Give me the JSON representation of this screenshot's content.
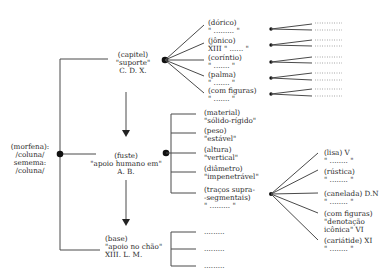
{
  "root": {
    "lines": [
      "(morfena):",
      "/coluna/",
      "semema:",
      "/coluna/"
    ]
  },
  "capitel": {
    "lines": [
      "(capitel)",
      "\"suporte\"",
      "C. D. X."
    ],
    "children": [
      {
        "lines": [
          "(dórico)",
          "\" ......... \""
        ]
      },
      {
        "lines": [
          "(jônico)",
          "XIII \" ...... \""
        ]
      },
      {
        "lines": [
          "(coríntio)",
          "\" ....... \""
        ]
      },
      {
        "lines": [
          "(palma)",
          "\" ....... \""
        ]
      },
      {
        "lines": [
          "(com figuras)",
          "\" ....... \""
        ]
      }
    ],
    "leaf_placeholder": "........."
  },
  "fuste": {
    "lines": [
      "(fuste)",
      "\"apoio humano em\"",
      "A. B."
    ],
    "children": [
      {
        "lines": [
          "(material)",
          "\"sólido-rígido\""
        ]
      },
      {
        "lines": [
          "(peso)",
          "\"estável\""
        ]
      },
      {
        "lines": [
          "(altura)",
          "\"vertical\""
        ]
      },
      {
        "lines": [
          "(diâmetro)",
          "\"impenetrável\""
        ]
      },
      {
        "lines": [
          "(traços supra-",
          "-segmentais)",
          "\" ......... \""
        ]
      }
    ],
    "supra_children": [
      {
        "lines": [
          "(lisa) V",
          "\" ........ \""
        ]
      },
      {
        "lines": [
          "(rústica)",
          "\" ........ \""
        ]
      },
      {
        "lines": [
          "(canelada) D.N",
          "\" ........ \""
        ]
      },
      {
        "lines": [
          "(com figuras)",
          "\"denotação",
          "icônica\" VI"
        ]
      },
      {
        "lines": [
          "(cariátide) XI",
          "\" ........ \""
        ]
      }
    ]
  },
  "base": {
    "lines": [
      "(base)",
      "\"apoio no chão\"",
      "XIII. L. M."
    ],
    "children": [
      {
        "lines": [
          "........."
        ]
      },
      {
        "lines": [
          "........."
        ]
      },
      {
        "lines": [
          "........."
        ]
      }
    ]
  }
}
